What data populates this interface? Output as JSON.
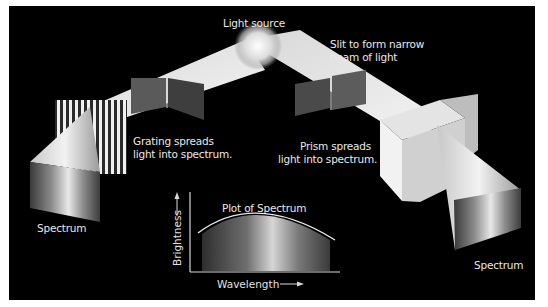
{
  "diagram": {
    "colors": {
      "background": "#000000",
      "margin": "#ffffff",
      "beam": "#e6e6e6",
      "slit_panel": "#555555",
      "label_text": "#e8e8e8"
    },
    "labels": {
      "light_source": "Light source",
      "slit_line1": "Slit to form narrow",
      "slit_line2": "beam of light",
      "grating_line1": "Grating spreads",
      "grating_line2": "light into spectrum.",
      "prism_line1": "Prism spreads",
      "prism_line2": "light into spectrum.",
      "spectrum_left": "Spectrum",
      "spectrum_right": "Spectrum"
    },
    "plot": {
      "title": "Plot of Spectrum",
      "xlabel": "Wavelength",
      "ylabel": "Brightness",
      "x_arrow": "⟶",
      "y_arrow": "⟶"
    },
    "icons": {
      "light_source": "sun-glow-icon",
      "grating": "striped-grating",
      "prism": "white-cube-prism"
    }
  }
}
